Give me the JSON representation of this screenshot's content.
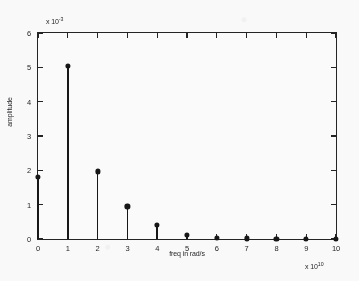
{
  "chart_data": {
    "type": "scatter",
    "plot_style": "stem",
    "title": "",
    "xlabel": "freq in rad/s",
    "ylabel": "amplitude",
    "x_exponent_label": "x 10",
    "x_exponent_value": "10",
    "y_exponent_label": "x 10",
    "y_exponent_value": "-3",
    "x": [
      0,
      1,
      2,
      3,
      4,
      5,
      6,
      7,
      8,
      9,
      10
    ],
    "values": [
      1.82,
      5.05,
      1.97,
      0.95,
      0.4,
      0.13,
      0.04,
      0.02,
      0.01,
      0.01,
      0.0
    ],
    "xlim": [
      0,
      10
    ],
    "ylim": [
      0,
      6
    ],
    "xticks": [
      0,
      1,
      2,
      3,
      4,
      5,
      6,
      7,
      8,
      9,
      10
    ],
    "xticklabels": [
      "0",
      "1",
      "2",
      "3",
      "4",
      "5",
      "6",
      "7",
      "8",
      "9",
      "10"
    ],
    "yticks": [
      0,
      1,
      2,
      3,
      4,
      5,
      6
    ],
    "yticklabels": [
      "0",
      "1",
      "2",
      "3",
      "4",
      "5",
      "6"
    ],
    "grid": false,
    "legend": null,
    "marker": "filled-circle",
    "series_color": "#0d0d0d"
  }
}
